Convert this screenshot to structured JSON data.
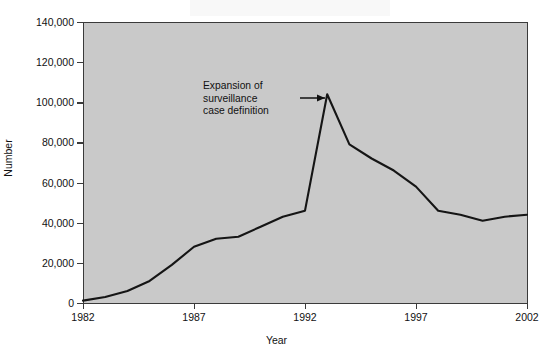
{
  "chart_data": {
    "type": "line",
    "title": "",
    "xlabel": "Year",
    "ylabel": "Number",
    "xlim": [
      1982,
      2002
    ],
    "ylim": [
      0,
      140000
    ],
    "grid": false,
    "legend": "none",
    "background_color": "#c9c9c9",
    "line_color": "#151515",
    "x_ticks": [
      "1982",
      "1987",
      "1992",
      "1997",
      "2002"
    ],
    "x_tick_values": [
      1982,
      1987,
      1992,
      1997,
      2002
    ],
    "y_ticks": [
      "0",
      "20,000",
      "40,000",
      "60,000",
      "80,000",
      "100,000",
      "120,000",
      "140,000"
    ],
    "y_tick_values": [
      0,
      20000,
      40000,
      60000,
      80000,
      100000,
      120000,
      140000
    ],
    "x": [
      1982,
      1983,
      1984,
      1985,
      1986,
      1987,
      1988,
      1989,
      1990,
      1991,
      1992,
      1993,
      1994,
      1995,
      1996,
      1997,
      1998,
      1999,
      2000,
      2001,
      2002
    ],
    "values": [
      1200,
      3000,
      6000,
      11000,
      19000,
      28000,
      32000,
      33000,
      38000,
      43000,
      46000,
      104000,
      79000,
      72000,
      66000,
      58000,
      46000,
      44000,
      41000,
      43000,
      44000
    ],
    "series": [
      {
        "name": "AIDS cases reported",
        "values": [
          1200,
          3000,
          6000,
          11000,
          19000,
          28000,
          32000,
          33000,
          38000,
          43000,
          46000,
          104000,
          79000,
          72000,
          66000,
          58000,
          46000,
          44000,
          41000,
          43000,
          44000
        ]
      }
    ],
    "annotations": [
      {
        "text": "Expansion of surveillance case definition",
        "lines": [
          "Expansion of",
          "surveillance",
          "case definition"
        ],
        "points_to_year": 1993,
        "points_to_value": 104000,
        "arrow": "right"
      }
    ]
  },
  "axis": {
    "y_label": "Number",
    "x_label": "Year",
    "y_ticks": [
      {
        "label": "140,000",
        "value": 140000
      },
      {
        "label": "120,000",
        "value": 120000
      },
      {
        "label": "100,000",
        "value": 100000
      },
      {
        "label": "80,000",
        "value": 80000
      },
      {
        "label": "60,000",
        "value": 60000
      },
      {
        "label": "40,000",
        "value": 40000
      },
      {
        "label": "20,000",
        "value": 20000
      },
      {
        "label": "0",
        "value": 0
      }
    ],
    "x_ticks": [
      {
        "label": "1982",
        "value": 1982
      },
      {
        "label": "1987",
        "value": 1987
      },
      {
        "label": "1992",
        "value": 1992
      },
      {
        "label": "1997",
        "value": 1997
      },
      {
        "label": "2002",
        "value": 2002
      }
    ]
  },
  "annotation": {
    "line1": "Expansion of",
    "line2": "surveillance",
    "line3": "case definition"
  }
}
